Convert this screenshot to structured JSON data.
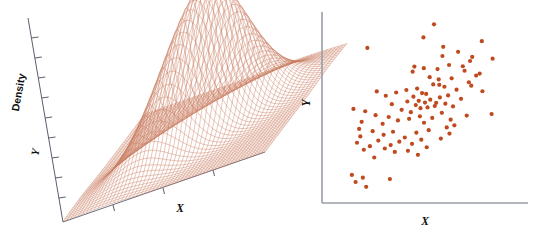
{
  "figure": {
    "background_color": "#ffffff",
    "panels": [
      {
        "id": "panel-left",
        "type": "surface-3d",
        "axis_labels": {
          "z": "Density",
          "y": "Y",
          "x": "X"
        },
        "mesh_color": "#c8785c",
        "axis_color": "#5a5f6e"
      },
      {
        "id": "panel-right",
        "type": "scatter",
        "axis_labels": {
          "y": "Y",
          "x": "X"
        },
        "point_color": "#c0491f",
        "axis_color": "#9a9da6"
      }
    ]
  },
  "chart_data": [
    {
      "type": "surface",
      "title": "",
      "xlabel": "X",
      "ylabel": "Y",
      "zlabel": "Density",
      "grid": true,
      "legend": "none",
      "description": "Bivariate normal density surface rendered as a fine wireframe mesh with a single central peak",
      "surface": {
        "function": "bivariate-gaussian",
        "peak_x": 0.0,
        "peak_y": 0.0,
        "peak_density": 1.0,
        "sigma_x": 1.0,
        "sigma_y": 1.0,
        "correlation": 0.6,
        "xlim": [
          -3,
          3
        ],
        "ylim": [
          -3,
          3
        ],
        "zlim": [
          0,
          1
        ],
        "mesh_steps_x": 52,
        "mesh_steps_y": 52
      },
      "z_axis_ticks": 6,
      "y_axis_ticks": 6,
      "x_axis_ticks": 4
    },
    {
      "type": "scatter",
      "title": "",
      "xlabel": "X",
      "ylabel": "Y",
      "grid": false,
      "legend": "none",
      "xlim": [
        0,
        100
      ],
      "ylim": [
        0,
        100
      ],
      "n_points": 100,
      "correlation": 0.6,
      "points": [
        [
          55.1,
          96.5
        ],
        [
          49.7,
          89.2
        ],
        [
          79.5,
          87.1
        ],
        [
          59.8,
          84.0
        ],
        [
          21.1,
          83.4
        ],
        [
          67.4,
          81.2
        ],
        [
          59.4,
          78.9
        ],
        [
          74.6,
          78.4
        ],
        [
          85.0,
          77.4
        ],
        [
          73.5,
          76.1
        ],
        [
          45.1,
          73.0
        ],
        [
          62.8,
          73.9
        ],
        [
          49.9,
          72.1
        ],
        [
          56.9,
          71.6
        ],
        [
          70.7,
          70.7
        ],
        [
          44.2,
          70.2
        ],
        [
          78.4,
          69.1
        ],
        [
          76.6,
          68.0
        ],
        [
          52.9,
          67.1
        ],
        [
          64.1,
          66.5
        ],
        [
          57.5,
          65.9
        ],
        [
          72.9,
          64.3
        ],
        [
          54.7,
          63.1
        ],
        [
          74.1,
          62.4
        ],
        [
          60.4,
          61.8
        ],
        [
          46.5,
          60.8
        ],
        [
          66.6,
          60.2
        ],
        [
          41.0,
          60.0
        ],
        [
          79.8,
          59.3
        ],
        [
          25.9,
          59.2
        ],
        [
          35.8,
          58.6
        ],
        [
          49.0,
          58.3
        ],
        [
          51.1,
          57.8
        ],
        [
          62.3,
          57.0
        ],
        [
          30.5,
          56.8
        ],
        [
          44.6,
          56.3
        ],
        [
          58.1,
          55.9
        ],
        [
          68.9,
          55.1
        ],
        [
          53.2,
          54.6
        ],
        [
          47.3,
          54.0
        ],
        [
          41.5,
          53.6
        ],
        [
          50.5,
          53.0
        ],
        [
          56.2,
          52.9
        ],
        [
          60.9,
          52.4
        ],
        [
          33.6,
          52.1
        ],
        [
          45.8,
          51.6
        ],
        [
          55.5,
          51.1
        ],
        [
          64.8,
          50.9
        ],
        [
          51.8,
          50.3
        ],
        [
          48.2,
          49.9
        ],
        [
          14.0,
          49.5
        ],
        [
          38.6,
          49.0
        ],
        [
          20.0,
          48.2
        ],
        [
          43.3,
          47.7
        ],
        [
          59.1,
          47.3
        ],
        [
          84.5,
          46.6
        ],
        [
          25.3,
          46.0
        ],
        [
          47.9,
          45.4
        ],
        [
          32.0,
          45.0
        ],
        [
          54.2,
          44.5
        ],
        [
          42.4,
          44.0
        ],
        [
          63.6,
          43.5
        ],
        [
          36.7,
          43.1
        ],
        [
          18.2,
          42.3
        ],
        [
          50.0,
          41.8
        ],
        [
          28.9,
          41.2
        ],
        [
          65.5,
          40.4
        ],
        [
          61.6,
          39.2
        ],
        [
          16.9,
          38.4
        ],
        [
          52.4,
          37.7
        ],
        [
          23.8,
          37.1
        ],
        [
          34.2,
          36.8
        ],
        [
          46.1,
          36.3
        ],
        [
          63.0,
          35.8
        ],
        [
          29.4,
          35.1
        ],
        [
          17.5,
          34.2
        ],
        [
          40.2,
          33.6
        ],
        [
          58.6,
          33.0
        ],
        [
          48.6,
          32.4
        ],
        [
          26.7,
          31.9
        ],
        [
          37.4,
          31.3
        ],
        [
          15.8,
          30.7
        ],
        [
          43.9,
          30.1
        ],
        [
          33.0,
          29.4
        ],
        [
          22.4,
          28.8
        ],
        [
          51.4,
          28.2
        ],
        [
          30.0,
          27.5
        ],
        [
          19.3,
          26.8
        ],
        [
          41.8,
          26.2
        ],
        [
          35.1,
          25.6
        ],
        [
          46.9,
          24.0
        ],
        [
          24.6,
          22.5
        ],
        [
          13.2,
          12.8
        ],
        [
          18.8,
          11.3
        ],
        [
          32.6,
          10.5
        ],
        [
          15.1,
          8.9
        ],
        [
          20.5,
          6.2
        ],
        [
          57.8,
          62.9
        ],
        [
          69.8,
          73.2
        ],
        [
          71.8,
          45.8
        ]
      ]
    }
  ]
}
